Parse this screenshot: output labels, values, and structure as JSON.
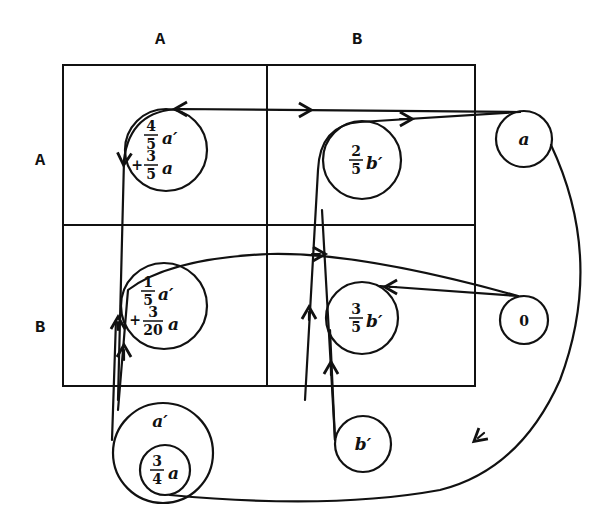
{
  "diagram": {
    "column_headers": [
      "A",
      "B"
    ],
    "row_headers": [
      "A",
      "B"
    ],
    "nodes": {
      "AA": {
        "line1_num": "4",
        "line1_den": "5",
        "line1_var": "a′",
        "line2_sign": "+",
        "line2_num": "3",
        "line2_den": "5",
        "line2_var": "a"
      },
      "BA": {
        "line1_num": "1",
        "line1_den": "5",
        "line1_var": "a′",
        "line2_sign": "+",
        "line2_num": "3",
        "line2_den": "20",
        "line2_var": "a"
      },
      "AB": {
        "num": "2",
        "den": "5",
        "var": "b′"
      },
      "BB": {
        "num": "3",
        "den": "5",
        "var": "b′"
      },
      "source_a": {
        "label": "a"
      },
      "source_zero": {
        "label": "0"
      },
      "source_b_prime": {
        "label": "b′"
      },
      "source_a_prime_outer": {
        "label": "a′"
      },
      "source_a_prime_inner": {
        "num": "3",
        "den": "4",
        "var": "a"
      }
    },
    "colors": {
      "ink": "#111111",
      "background": "#ffffff"
    }
  }
}
